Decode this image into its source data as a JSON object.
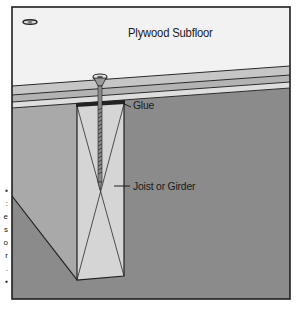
{
  "diagram": {
    "labels": {
      "subfloor": "Plywood Subfloor",
      "glue": "Glue",
      "joist": "Joist or Girder"
    },
    "caption_fragments": [
      "▪",
      ":",
      "e",
      "s",
      "o",
      "r",
      ".",
      "▪"
    ],
    "colors": {
      "frame": "#1f1f1f",
      "sky": "#f2f2f2",
      "subfloor_top": "#c4c4c4",
      "subfloor_mid": "#b0b0b0",
      "subfloor_bottom": "#dcdcdc",
      "wall_light": "#a8a8a8",
      "wall_dark": "#8a8a8a",
      "joist_face": "#d4d4d4",
      "screw": "#555555"
    }
  }
}
